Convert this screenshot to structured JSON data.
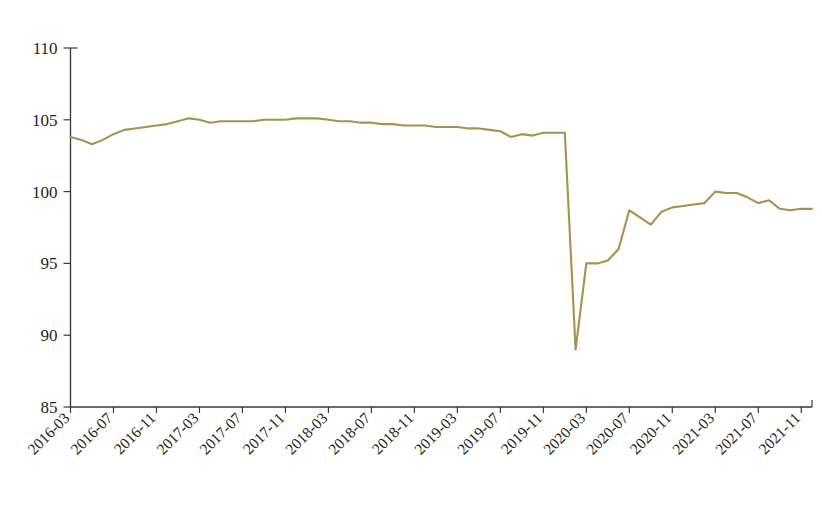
{
  "chart_data": {
    "type": "line",
    "title": "",
    "subtitle": "",
    "xlabel": "",
    "ylabel": "",
    "ylim": [
      85,
      110
    ],
    "yticks": [
      85,
      90,
      95,
      100,
      105,
      110
    ],
    "grid": false,
    "legend": null,
    "series_color": "#a89050",
    "axis_color": "#3a3a3a",
    "x_tick_labels": [
      "2016-03",
      "2016-07",
      "2016-11",
      "2017-03",
      "2017-07",
      "2017-11",
      "2018-03",
      "2018-07",
      "2018-11",
      "2019-03",
      "2019-07",
      "2019-11",
      "2020-03",
      "2020-07",
      "2020-11",
      "2021-03",
      "2021-07",
      "2021-11"
    ],
    "x": [
      "2016-03",
      "2016-04",
      "2016-05",
      "2016-06",
      "2016-07",
      "2016-08",
      "2016-09",
      "2016-10",
      "2016-11",
      "2016-12",
      "2017-01",
      "2017-02",
      "2017-03",
      "2017-04",
      "2017-05",
      "2017-06",
      "2017-07",
      "2017-08",
      "2017-09",
      "2017-10",
      "2017-11",
      "2017-12",
      "2018-01",
      "2018-02",
      "2018-03",
      "2018-04",
      "2018-05",
      "2018-06",
      "2018-07",
      "2018-08",
      "2018-09",
      "2018-10",
      "2018-11",
      "2018-12",
      "2019-01",
      "2019-02",
      "2019-03",
      "2019-04",
      "2019-05",
      "2019-06",
      "2019-07",
      "2019-08",
      "2019-09",
      "2019-10",
      "2019-11",
      "2019-12",
      "2020-01",
      "2020-02",
      "2020-03",
      "2020-04",
      "2020-05",
      "2020-06",
      "2020-07",
      "2020-08",
      "2020-09",
      "2020-10",
      "2020-11",
      "2020-12",
      "2021-01",
      "2021-02",
      "2021-03",
      "2021-04",
      "2021-05",
      "2021-06",
      "2021-07",
      "2021-08",
      "2021-09",
      "2021-10",
      "2021-11",
      "2021-12"
    ],
    "series": [
      {
        "name": "index",
        "values": [
          103.8,
          103.6,
          103.3,
          103.6,
          104.0,
          104.3,
          104.4,
          104.5,
          104.6,
          104.7,
          104.9,
          105.1,
          105.0,
          104.8,
          104.9,
          104.9,
          104.9,
          104.9,
          105.0,
          105.0,
          105.0,
          105.1,
          105.1,
          105.1,
          105.0,
          104.9,
          104.9,
          104.8,
          104.8,
          104.7,
          104.7,
          104.6,
          104.6,
          104.6,
          104.5,
          104.5,
          104.5,
          104.4,
          104.4,
          104.3,
          104.2,
          103.8,
          104.0,
          103.9,
          104.1,
          104.1,
          104.1,
          89.0,
          95.0,
          95.0,
          95.2,
          96.0,
          98.7,
          98.2,
          97.7,
          98.6,
          98.9,
          99.0,
          99.1,
          99.2,
          100.0,
          99.9,
          99.9,
          99.6,
          99.2,
          99.4,
          98.8,
          98.7,
          98.8,
          98.8
        ]
      }
    ]
  },
  "caption": {
    "text": ""
  },
  "figure": {
    "name": "line-chart"
  }
}
